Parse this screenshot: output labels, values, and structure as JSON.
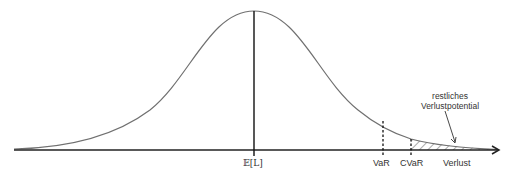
{
  "diagram": {
    "type": "normal-distribution-loss",
    "labels": {
      "mean": "𝔼[L]",
      "var": "VaR",
      "cvar": "CVaR",
      "x_axis": "Verlust",
      "annotation_line1": "restliches",
      "annotation_line2": "Verlustpotential"
    },
    "colors": {
      "curve": "#707070",
      "axis": "#222222",
      "hatch": "#555555"
    }
  }
}
